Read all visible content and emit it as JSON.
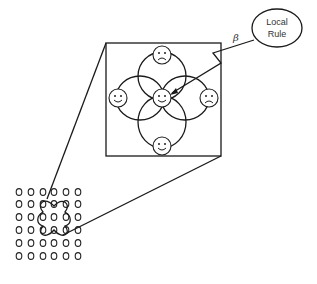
{
  "diagram": {
    "rule_label_line1": "Local",
    "rule_label_line2": "Rule",
    "beta_label": "β",
    "zoom_box": {
      "x": 106,
      "y": 43,
      "width": 115,
      "height": 113
    },
    "faces": [
      {
        "id": "top",
        "mood": "sad",
        "cx": 162,
        "cy": 55
      },
      {
        "id": "left",
        "mood": "happy",
        "cx": 118,
        "cy": 98
      },
      {
        "id": "center",
        "mood": "happy",
        "cx": 162,
        "cy": 98
      },
      {
        "id": "right",
        "mood": "sad",
        "cx": 209,
        "cy": 98
      },
      {
        "id": "bottom",
        "mood": "happy",
        "cx": 162,
        "cy": 146
      }
    ],
    "lattice": {
      "rows": 6,
      "cols": 6,
      "highlight_center_row": 3,
      "highlight_center_col": 4
    },
    "colors": {
      "stroke": "#1a1a1a",
      "background": "#ffffff"
    }
  }
}
